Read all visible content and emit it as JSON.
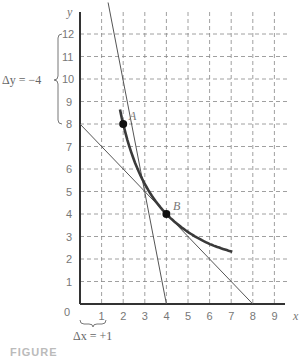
{
  "chart_data": {
    "type": "line",
    "title": "",
    "xlabel": "x",
    "ylabel": "y",
    "xlim": [
      0,
      9
    ],
    "ylim": [
      0,
      12
    ],
    "x_ticks": [
      "1",
      "2",
      "3",
      "4",
      "5",
      "6",
      "7",
      "8",
      "9"
    ],
    "y_ticks": [
      "1",
      "2",
      "3",
      "4",
      "5",
      "6",
      "7",
      "8",
      "9",
      "10",
      "11",
      "12"
    ],
    "origin_label": "0",
    "grid": true,
    "grid_style": "dashed",
    "series": [
      {
        "name": "curve y = 16/x",
        "kind": "curve",
        "x": [
          1.85,
          2,
          2.5,
          3,
          3.5,
          4,
          5,
          6,
          7
        ],
        "y": [
          11.8,
          8,
          6.4,
          5.33,
          4.57,
          4,
          3.2,
          2.67,
          2.55
        ]
      },
      {
        "name": "tangent at A",
        "kind": "line",
        "x": [
          1.3,
          4
        ],
        "y": [
          13.4,
          0
        ]
      },
      {
        "name": "tangent at B",
        "kind": "line",
        "x": [
          0,
          8
        ],
        "y": [
          8,
          0
        ]
      }
    ],
    "points": [
      {
        "label": "A",
        "x": 2,
        "y": 8
      },
      {
        "label": "B",
        "x": 4,
        "y": 4
      }
    ],
    "annotations": [
      {
        "text": "Δy = −4",
        "kind": "brace",
        "spans": "y from 8 to 12"
      },
      {
        "text": "Δx = +1",
        "kind": "brace",
        "spans": "x from 0 to 1"
      }
    ],
    "caption": "FIGURE ..."
  },
  "labels": {
    "y_axis": "y",
    "x_axis": "x",
    "origin": "0",
    "point_a": "A",
    "point_b": "B",
    "delta_y": "Δy = −4",
    "delta_x": "Δx = +1",
    "caption": "FIGURE"
  }
}
